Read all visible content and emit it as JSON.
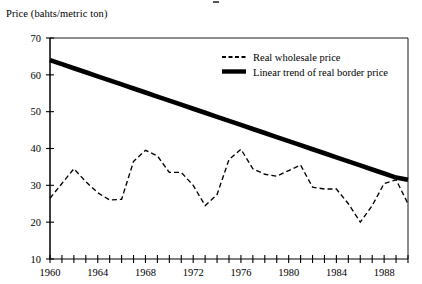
{
  "figure": {
    "y_axis_label": "Price (bahts/metric ton)"
  },
  "legend": {
    "items": [
      {
        "label": "Real wholesale price",
        "style": "dashed"
      },
      {
        "label": "Linear trend of real border price",
        "style": "solid-thick"
      }
    ]
  },
  "axes": {
    "y_ticks": [
      "70",
      "60",
      "50",
      "40",
      "30",
      "20",
      "10"
    ],
    "x_ticks": [
      "1960",
      "1964",
      "1968",
      "1972",
      "1976",
      "1980",
      "1984",
      "1988"
    ]
  },
  "chart_data": {
    "type": "line",
    "title": "",
    "xlabel": "",
    "ylabel": "Price (bahts/metric ton)",
    "xlim": [
      1960,
      1990
    ],
    "ylim": [
      10,
      70
    ],
    "ytick_values": [
      10,
      20,
      30,
      40,
      50,
      60,
      70
    ],
    "xtick_values": [
      1960,
      1961,
      1962,
      1963,
      1964,
      1965,
      1966,
      1967,
      1968,
      1969,
      1970,
      1971,
      1972,
      1973,
      1974,
      1975,
      1976,
      1977,
      1978,
      1979,
      1980,
      1981,
      1982,
      1983,
      1984,
      1985,
      1986,
      1987,
      1988,
      1989,
      1990
    ],
    "xtick_labeled": [
      1960,
      1964,
      1968,
      1972,
      1976,
      1980,
      1984,
      1988
    ],
    "grid": false,
    "legend_position": "top-right-inside",
    "x": [
      1960,
      1961,
      1962,
      1963,
      1964,
      1965,
      1966,
      1967,
      1968,
      1969,
      1970,
      1971,
      1972,
      1973,
      1974,
      1975,
      1976,
      1977,
      1978,
      1979,
      1980,
      1981,
      1982,
      1983,
      1984,
      1985,
      1986,
      1987,
      1988,
      1989,
      1990
    ],
    "series": [
      {
        "name": "Real wholesale price",
        "style": "dashed",
        "values": [
          26.5,
          30.5,
          34.5,
          31.0,
          28.0,
          26.0,
          26.2,
          36.5,
          39.5,
          38.0,
          33.5,
          33.5,
          30.0,
          24.5,
          27.5,
          37.0,
          39.8,
          34.5,
          33.0,
          32.5,
          34.0,
          35.5,
          29.5,
          29.0,
          29.0,
          25.0,
          20.0,
          24.5,
          30.5,
          31.5,
          25.0
        ]
      },
      {
        "name": "Linear trend of real border price",
        "style": "solid-thick",
        "values": [
          64.0,
          62.9,
          61.8,
          60.7,
          59.6,
          58.5,
          57.4,
          56.3,
          55.2,
          54.1,
          53.0,
          51.9,
          50.8,
          49.7,
          48.6,
          47.5,
          46.4,
          45.3,
          44.2,
          43.1,
          42.0,
          40.9,
          39.8,
          38.7,
          37.6,
          36.5,
          35.4,
          34.3,
          33.2,
          32.1,
          31.5
        ]
      }
    ]
  }
}
